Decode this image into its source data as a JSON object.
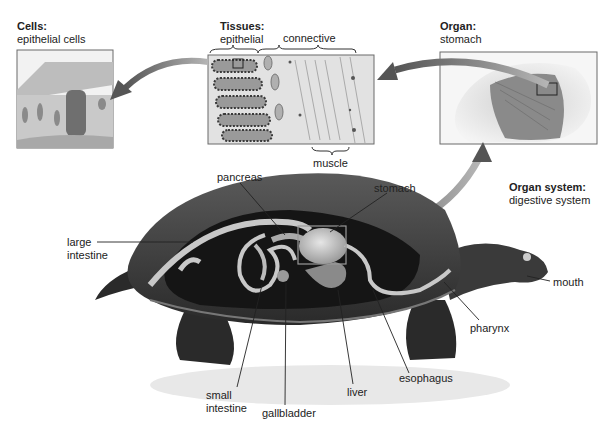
{
  "levels": {
    "cells": {
      "heading": "Cells:",
      "subheading": "epithelial cells"
    },
    "tissues": {
      "heading": "Tissues:",
      "subheading": "epithelial",
      "connective_label": "connective",
      "muscle_label": "muscle"
    },
    "organ": {
      "heading": "Organ:",
      "subheading": "stomach"
    },
    "organ_system": {
      "heading": "Organ system:",
      "subheading": "digestive system"
    }
  },
  "organ_labels": {
    "pancreas": "pancreas",
    "stomach": "stomach",
    "large_intestine_1": "large",
    "large_intestine_2": "intestine",
    "small_intestine_1": "small",
    "small_intestine_2": "intestine",
    "gallbladder": "gallbladder",
    "liver": "liver",
    "esophagus": "esophagus",
    "pharynx": "pharynx",
    "mouth": "mouth"
  },
  "colors": {
    "arrow": "#7a7a7a",
    "shell": "#3a3a3a",
    "gut": "#c8c8c8",
    "box_border": "#6a6a6a"
  }
}
